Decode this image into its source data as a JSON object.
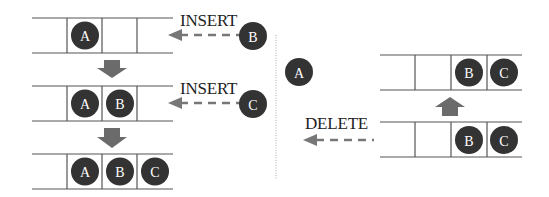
{
  "diagram": {
    "left_panel": {
      "rows": [
        {
          "cells": [
            "",
            "A",
            "",
            ""
          ]
        },
        {
          "cells": [
            "",
            "A",
            "B",
            ""
          ]
        },
        {
          "cells": [
            "",
            "A",
            "B",
            "C"
          ]
        }
      ],
      "operations": [
        {
          "label": "INSERT",
          "item": "B"
        },
        {
          "label": "INSERT",
          "item": "C"
        }
      ]
    },
    "right_panel": {
      "removed_item": "A",
      "operation": {
        "label": "DELETE"
      },
      "rows": [
        {
          "cells": [
            "",
            "",
            "B",
            "C"
          ]
        },
        {
          "cells": [
            "",
            "",
            "B",
            "C"
          ]
        }
      ]
    },
    "colors": {
      "node_fill": "#333333",
      "node_text": "#ffffff",
      "arrow": "#6b6b6b",
      "line": "#555555",
      "divider": "#aaaaaa"
    }
  }
}
